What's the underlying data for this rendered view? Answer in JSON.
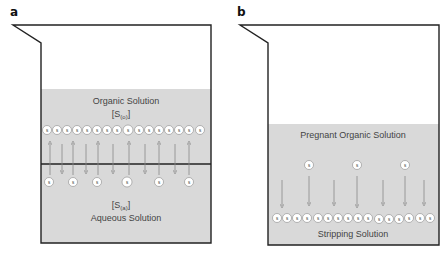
{
  "panels": [
    {
      "id": "a",
      "label": "a",
      "organic_label": "Organic Solution",
      "organic_conc": "[S",
      "organic_sub": "(o)",
      "organic_conc_close": "]",
      "aqueous_conc": "[S",
      "aqueous_sub": "(a)",
      "aqueous_conc_close": "]",
      "aqueous_label": "Aqueous Solution",
      "solute_glyph": "s",
      "organic_row_count": 16,
      "aqueous_solute_count": 6,
      "arrows": "bidirectional exchange across interface"
    },
    {
      "id": "b",
      "label": "b",
      "organic_label": "Pregnant Organic Solution",
      "stripping_label": "Stripping Solution",
      "solute_glyph": "s",
      "organic_solute_count": 3,
      "stripping_row_count": 16,
      "arrows": "downward transfer into stripping solution"
    }
  ],
  "colors": {
    "liquid": "#d9d9d9",
    "outline": "#222222",
    "arrow": "#888888",
    "text": "#444444"
  }
}
